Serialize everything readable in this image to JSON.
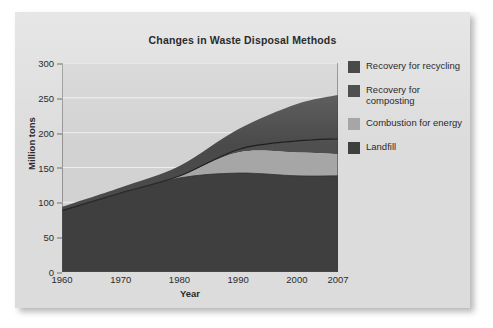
{
  "chart_data": {
    "type": "area",
    "title": "Changes in Waste Disposal Methods",
    "xlabel": "Year",
    "ylabel": "Million tons",
    "stacked": true,
    "grid": true,
    "legend_position": "right",
    "x": [
      1960,
      1970,
      1980,
      1990,
      2000,
      2007
    ],
    "xtick_labels": [
      "1960",
      "1970",
      "1980",
      "1990",
      "2000",
      "2007"
    ],
    "ytick_labels": [
      "0",
      "50",
      "100",
      "150",
      "200",
      "250",
      "300"
    ],
    "ytick_values": [
      0,
      50,
      100,
      150,
      200,
      250,
      300
    ],
    "ylim": [
      0,
      300
    ],
    "xlim": [
      1960,
      2007
    ],
    "series": [
      {
        "name": "Landfill",
        "color": "#3f3f3f",
        "values": [
          88,
          113,
          135,
          142,
          138,
          138
        ]
      },
      {
        "name": "Combustion for energy",
        "color": "#a6a6a6",
        "values": [
          0,
          0.4,
          2.7,
          29.7,
          33.7,
          31.4
        ]
      },
      {
        "name": "Recovery for composting",
        "color": "#4f4f4f",
        "values": [
          0,
          0,
          0,
          4.2,
          16.5,
          21.7
        ]
      },
      {
        "name": "Recovery for recycling",
        "color": "#4a4a4a",
        "values": [
          5.6,
          8.0,
          14.5,
          29.0,
          53.0,
          63.0
        ]
      }
    ],
    "cumulative_tops": {
      "landfill": [
        88,
        113,
        135,
        142,
        138,
        138
      ],
      "combustion": [
        88,
        113.4,
        137.7,
        171.7,
        171.7,
        169.4
      ],
      "composting": [
        88,
        113.4,
        137.7,
        175.9,
        188.2,
        191.1
      ],
      "recycling": [
        93.6,
        121.4,
        152.2,
        204.9,
        241.2,
        254.1
      ]
    }
  },
  "legend": {
    "items": [
      {
        "label": "Recovery for recycling",
        "color": "#4a4a4a"
      },
      {
        "label": "Recovery for composting",
        "color": "#4f4f4f"
      },
      {
        "label": "Combustion for energy",
        "color": "#a6a6a6"
      },
      {
        "label": "Landfill",
        "color": "#3f3f3f"
      }
    ]
  },
  "colors": {
    "page_background": "#ffffff",
    "panel_background": "#dcdcdc",
    "plot_background": "#d2d2d2",
    "gridline": "#efefef",
    "axis": "#555555",
    "text": "#2b2b2b"
  }
}
